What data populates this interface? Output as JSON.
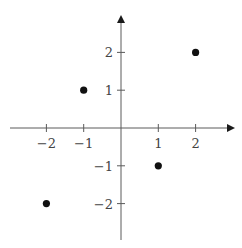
{
  "chart_data": {
    "type": "scatter",
    "title": "",
    "xlabel": "",
    "ylabel": "",
    "xlim": [
      -3,
      3
    ],
    "ylim": [
      -3,
      3
    ],
    "grid": false,
    "legend": null,
    "x_ticks": [
      -2,
      -1,
      1,
      2
    ],
    "y_ticks": [
      -2,
      -1,
      1,
      2
    ],
    "x_tick_labels": [
      "−2",
      "−1",
      "1",
      "2"
    ],
    "y_tick_labels": [
      "−2",
      "−1",
      "1",
      "2"
    ],
    "series": [
      {
        "name": "points",
        "points": [
          {
            "x": -2,
            "y": -2
          },
          {
            "x": -1,
            "y": 1
          },
          {
            "x": 1,
            "y": -1
          },
          {
            "x": 2,
            "y": 2
          }
        ]
      }
    ],
    "axes_style": "centered cartesian axes with arrowheads on positive ends"
  },
  "colors": {
    "axis": "#5a5a5a",
    "point": "#111111",
    "label": "#444444",
    "background": "#ffffff"
  }
}
